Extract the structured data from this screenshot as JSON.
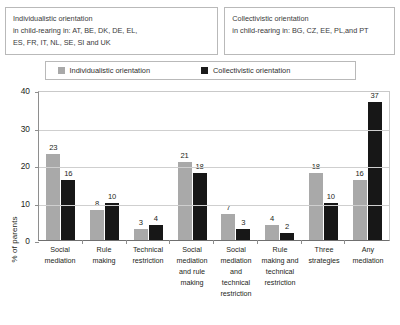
{
  "callouts": {
    "left": {
      "line1": "Individualistic orientation",
      "line2": "in child-rearing in: AT, BE, DK, DE, EL,",
      "line3": "ES, FR, IT, NL, SE, SI and UK"
    },
    "right": {
      "line1": "Collectivistic orientation",
      "line2": "in child-rearing in: BG, CZ, EE, PL,and PT"
    }
  },
  "legend": {
    "items": [
      {
        "label": "Individualistic orientation",
        "color": "#a9a9a9"
      },
      {
        "label": "Collectivistic orientation",
        "color": "#171717"
      }
    ]
  },
  "chart_data": {
    "type": "bar",
    "title": "",
    "xlabel": "",
    "ylabel": "% of parents",
    "ylim": [
      0,
      40
    ],
    "yticks": [
      0,
      10,
      20,
      30,
      40
    ],
    "grid": true,
    "legend_position": "top",
    "categories": [
      "Social mediation",
      "Rule making",
      "Technical restriction",
      "Social mediation and rule making",
      "Social mediation and technical restriction",
      "Rule making and technical restriction",
      "Three strategies",
      "Any mediation"
    ],
    "category_lines": [
      [
        "Social",
        "mediation"
      ],
      [
        "Rule",
        "making"
      ],
      [
        "Technical",
        "restriction"
      ],
      [
        "Social",
        "mediation",
        "and rule",
        "making"
      ],
      [
        "Social",
        "mediation",
        "and",
        "technical",
        "restriction"
      ],
      [
        "Rule",
        "making and",
        "technical",
        "restriction"
      ],
      [
        "Three",
        "strategies"
      ],
      [
        "Any",
        "mediation"
      ]
    ],
    "series": [
      {
        "name": "Individualistic orientation",
        "color": "#a9a9a9",
        "values": [
          23,
          8,
          3,
          21,
          7,
          4,
          18,
          16
        ]
      },
      {
        "name": "Collectivistic orientation",
        "color": "#171717",
        "values": [
          16,
          10,
          4,
          18,
          3,
          2,
          10,
          37
        ]
      }
    ]
  }
}
